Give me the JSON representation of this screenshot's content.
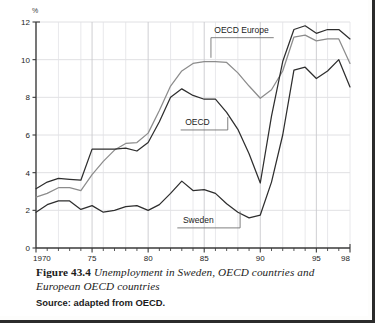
{
  "figure": {
    "number_label": "Figure 43.4",
    "title": "Unemployment in Sweden, OECD countries and European OECD countries",
    "source": "Source: adapted from OECD."
  },
  "chart_data": {
    "type": "line",
    "title": "Unemployment in Sweden, OECD countries and European OECD countries",
    "xlabel": "",
    "ylabel": "%",
    "unit_label": "%",
    "xlim": [
      1970,
      1998
    ],
    "ylim": [
      0,
      12
    ],
    "y_ticks": [
      0,
      2,
      4,
      6,
      8,
      10,
      12
    ],
    "y_tick_labels": [
      "0",
      "2",
      "4",
      "6",
      "8",
      "10",
      "12"
    ],
    "x_ticks": [
      1970,
      1975,
      1980,
      1985,
      1990,
      1995,
      1998
    ],
    "x_tick_labels": [
      "1970",
      "75",
      "80",
      "85",
      "90",
      "95",
      "98"
    ],
    "x_minor_tick_step": 1,
    "grid": true,
    "grid_color": "#d8d8dc",
    "legend": "inline-annotations",
    "x": [
      1970,
      1971,
      1972,
      1973,
      1974,
      1975,
      1976,
      1977,
      1978,
      1979,
      1980,
      1981,
      1982,
      1983,
      1984,
      1985,
      1986,
      1987,
      1988,
      1989,
      1990,
      1991,
      1992,
      1993,
      1994,
      1995,
      1996,
      1997,
      1998
    ],
    "series": [
      {
        "name": "OECD Europe",
        "color": "#8c8c8c",
        "annotation": "OECD Europe",
        "values": [
          2.7,
          2.9,
          3.2,
          3.2,
          3.05,
          3.9,
          4.6,
          5.2,
          5.55,
          5.6,
          6.1,
          7.3,
          8.6,
          9.4,
          9.8,
          9.9,
          9.9,
          9.85,
          9.3,
          8.6,
          7.95,
          8.4,
          9.4,
          11.2,
          11.3,
          11.0,
          11.1,
          11.1,
          9.8
        ]
      },
      {
        "name": "OECD",
        "color": "#2e2e2e",
        "annotation": "OECD",
        "values": [
          3.15,
          3.5,
          3.7,
          3.65,
          3.6,
          5.25,
          5.25,
          5.25,
          5.3,
          5.15,
          5.6,
          6.7,
          8.0,
          8.45,
          8.1,
          7.9,
          7.9,
          7.2,
          6.3,
          5.0,
          3.45,
          7.0,
          9.9,
          11.6,
          11.8,
          11.4,
          11.6,
          11.6,
          11.1
        ]
      },
      {
        "name": "Sweden",
        "color": "#2e2e2e",
        "annotation": "Sweden",
        "values": [
          1.9,
          2.3,
          2.5,
          2.5,
          2.05,
          2.25,
          1.9,
          2.0,
          2.2,
          2.25,
          2.0,
          2.3,
          2.9,
          3.55,
          3.05,
          3.1,
          2.9,
          2.35,
          1.9,
          1.6,
          1.75,
          3.5,
          6.0,
          9.45,
          9.6,
          9.0,
          9.4,
          10.0,
          8.55
        ]
      }
    ],
    "annotations": [
      {
        "text": "OECD Europe",
        "x": 1986.5,
        "y": 11.3
      },
      {
        "text": "OECD",
        "x": 1984.2,
        "y": 6.4
      },
      {
        "text": "Sweden",
        "x": 1984.0,
        "y": 1.2
      }
    ]
  }
}
